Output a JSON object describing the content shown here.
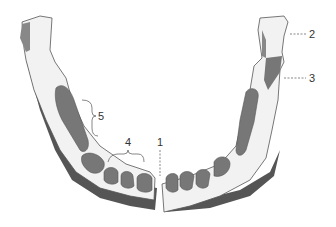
{
  "diagram": {
    "colors": {
      "bone_fill": "#f2f2f2",
      "bone_outline": "#555555",
      "tooth_fill": "#777777",
      "shadow": "#555555",
      "label": "#333333"
    },
    "labels": [
      {
        "id": "1",
        "text": "1",
        "leader": "dashed-vertical",
        "target": "midline between central incisors"
      },
      {
        "id": "2",
        "text": "2",
        "leader": "dashed-horizontal",
        "target": "condylar process (right ramus top)"
      },
      {
        "id": "3",
        "text": "3",
        "leader": "dashed-horizontal",
        "target": "coronoid process"
      },
      {
        "id": "4",
        "text": "4",
        "leader": "brace",
        "target": "incisors / anterior teeth group"
      },
      {
        "id": "5",
        "text": "5",
        "leader": "brace",
        "target": "posterior teeth / molar region"
      }
    ]
  }
}
